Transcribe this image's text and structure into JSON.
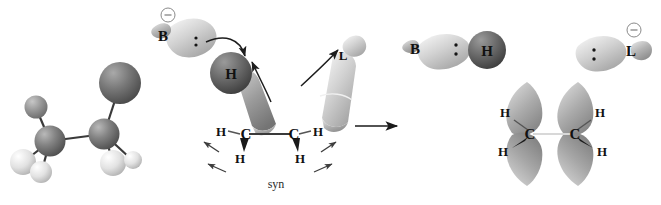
{
  "figure": {
    "background_color": "#ffffff",
    "caption": "syn"
  },
  "reaction_arrow": {
    "name": "reaction-arrow",
    "label": ""
  },
  "panels": {
    "reactant_model": {
      "name": "ball-and-stick-reactant",
      "description": "space-filling ball-and-stick model of haloalkane",
      "atoms": [
        {
          "label": "",
          "kind": "leaving-group",
          "color": "#6e6e6e",
          "cx": 120,
          "cy": 83,
          "r": 21
        },
        {
          "label": "",
          "kind": "carbon",
          "color": "#7b7b7b",
          "cx": 104,
          "cy": 134,
          "r": 15
        },
        {
          "label": "",
          "kind": "carbon",
          "color": "#6c6c6c",
          "cx": 50,
          "cy": 141,
          "r": 15
        },
        {
          "label": "",
          "kind": "hydrogen-dark",
          "color": "#8c8c8c",
          "cx": 36,
          "cy": 107,
          "r": 11
        },
        {
          "label": "",
          "kind": "hydrogen",
          "color": "#e3e3e3",
          "cx": 23,
          "cy": 162,
          "r": 13
        },
        {
          "label": "",
          "kind": "hydrogen",
          "color": "#ededed",
          "cx": 41,
          "cy": 172,
          "r": 11
        },
        {
          "label": "",
          "kind": "hydrogen",
          "color": "#e6e6e6",
          "cx": 113,
          "cy": 163,
          "r": 13
        },
        {
          "label": "",
          "kind": "hydrogen",
          "color": "#efefef",
          "cx": 133,
          "cy": 160,
          "r": 9
        }
      ]
    },
    "transition_state": {
      "name": "transition-state",
      "base_label": "B",
      "base_charge": "−",
      "hydrogen_label": "H",
      "leaving_group_label": "L",
      "carbon_left_label": "C",
      "carbon_right_label": "C",
      "hydrogens": [
        "H",
        "H",
        "H",
        "H"
      ],
      "lone_pair_count": 2,
      "caption": "syn"
    },
    "product_base": {
      "name": "product-conjugate-acid",
      "base_label": "B",
      "hydrogen_label": "H",
      "lone_pair_count": 2
    },
    "product_leaving_group": {
      "name": "product-leaving-group",
      "label": "L",
      "charge": "−",
      "lone_pair_count": 2
    },
    "product_alkene": {
      "name": "product-alkene",
      "carbon_left_label": "C",
      "carbon_right_label": "C",
      "hydrogens": [
        "H",
        "H",
        "H",
        "H"
      ],
      "orbital_count": 4
    }
  },
  "labels": {
    "B_base": "B",
    "H_transfer": "H",
    "L_leaving": "L",
    "C_left": "C",
    "C_right": "C",
    "H1": "H",
    "H2": "H",
    "H3": "H",
    "H4": "H",
    "B_product": "B",
    "H_product": "H",
    "L_product": "L",
    "pC_left": "C",
    "pC_right": "C",
    "pH1": "H",
    "pH2": "H",
    "pH3": "H",
    "pH4": "H",
    "minus_base": "−",
    "minus_leaving": "−",
    "syn": "syn"
  },
  "colors": {
    "background": "#ffffff",
    "carbon_sphere": "#767676",
    "hydrogen_sphere": "#e8e8e8",
    "dark_hydrogen": "#5a5a5a",
    "orbital_light": "#cfcfcf",
    "orbital_mid": "#a8a8a8",
    "orbital_dark": "#8f8f8f",
    "bond": "#3a3a3a",
    "text": "#111111",
    "arrow": "#1d1d1d"
  }
}
